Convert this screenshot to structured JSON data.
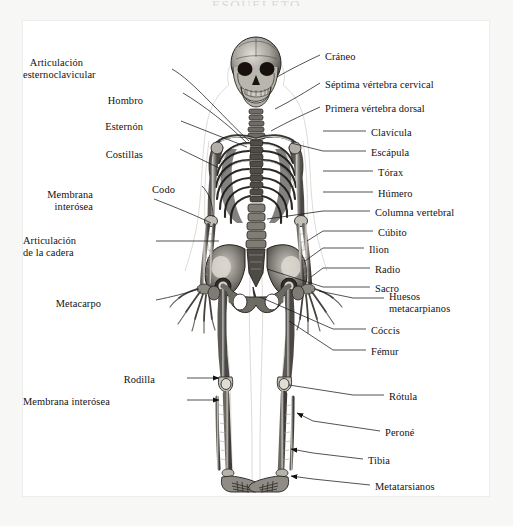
{
  "page": {
    "title": "ESQUELETO",
    "background": "#f7f7f5",
    "plate_background": "#ffffff",
    "border_color": "#ededed",
    "ink_color": "#121212"
  },
  "figure": {
    "name": "human-skeleton-anterior-view",
    "style": "engraving"
  },
  "labels_left": [
    {
      "id": "articulacion-esternoclavicular",
      "lines": [
        "Articulación",
        "esternoclavicular"
      ],
      "x": 60,
      "y": 36,
      "align": "right",
      "leader": "diagonal",
      "arrow": false
    },
    {
      "id": "hombro",
      "lines": [
        "Hombro"
      ],
      "x": 120,
      "y": 74,
      "align": "right",
      "leader": "diagonal",
      "arrow": false
    },
    {
      "id": "esternon",
      "lines": [
        "Esternón"
      ],
      "x": 120,
      "y": 100,
      "align": "right",
      "leader": "diagonal",
      "arrow": false
    },
    {
      "id": "costillas",
      "lines": [
        "Costillas"
      ],
      "x": 120,
      "y": 128,
      "align": "right",
      "leader": "diagonal",
      "arrow": false
    },
    {
      "id": "membrana-interosea-brazo",
      "lines": [
        "Membrana",
        "interósea"
      ],
      "x": 70,
      "y": 168,
      "align": "right",
      "leader": "diagonal",
      "arrow": false
    },
    {
      "id": "codo",
      "lines": [
        "Codo"
      ],
      "x": 152,
      "y": 163,
      "align": "right",
      "leader": "diagonal",
      "arrow": false
    },
    {
      "id": "articulacion-de-la-cadera",
      "lines": [
        "Articulación",
        "de la cadera"
      ],
      "x": 50,
      "y": 214,
      "align": "right",
      "leader": "straight",
      "arrow": false
    },
    {
      "id": "metacarpo",
      "lines": [
        "Metacarpo"
      ],
      "x": 78,
      "y": 277,
      "align": "right",
      "leader": "diagonal",
      "arrow": false
    },
    {
      "id": "rodilla",
      "lines": [
        "Rodilla"
      ],
      "x": 132,
      "y": 353,
      "align": "right",
      "leader": "arrow",
      "arrow": true
    },
    {
      "id": "membrana-interosea-pierna",
      "lines": [
        "Membrana interósea"
      ],
      "x": 72,
      "y": 375,
      "align": "right",
      "leader": "arrow",
      "arrow": true
    }
  ],
  "labels_right": [
    {
      "id": "craneo",
      "lines": [
        "Cráneo"
      ],
      "x": 302,
      "y": 30,
      "align": "left",
      "leader": "diagonal",
      "arrow": false
    },
    {
      "id": "septima-vertebra-cervical",
      "lines": [
        "Séptima vértebra cervical"
      ],
      "x": 302,
      "y": 58,
      "align": "left",
      "leader": "diagonal",
      "arrow": false
    },
    {
      "id": "primera-vertebra-dorsal",
      "lines": [
        "Primera vértebra dorsal"
      ],
      "x": 302,
      "y": 82,
      "align": "left",
      "leader": "diagonal",
      "arrow": false
    },
    {
      "id": "clavicula",
      "lines": [
        "Clavícula"
      ],
      "x": 348,
      "y": 106,
      "align": "left",
      "leader": "straight",
      "arrow": false
    },
    {
      "id": "escapula",
      "lines": [
        "Escápula"
      ],
      "x": 348,
      "y": 126,
      "align": "left",
      "leader": "diagonal",
      "arrow": false
    },
    {
      "id": "torax",
      "lines": [
        "Tórax"
      ],
      "x": 355,
      "y": 146,
      "align": "left",
      "leader": "straight",
      "arrow": false
    },
    {
      "id": "humero",
      "lines": [
        "Húmero"
      ],
      "x": 355,
      "y": 167,
      "align": "left",
      "leader": "straight",
      "arrow": false
    },
    {
      "id": "columna-vertebral",
      "lines": [
        "Columna vertebral"
      ],
      "x": 352,
      "y": 186,
      "align": "left",
      "leader": "diagonal",
      "arrow": false
    },
    {
      "id": "cubito",
      "lines": [
        "Cúbito"
      ],
      "x": 355,
      "y": 206,
      "align": "left",
      "leader": "diagonal",
      "arrow": false
    },
    {
      "id": "ilion",
      "lines": [
        "Ilion"
      ],
      "x": 346,
      "y": 223,
      "align": "left",
      "leader": "straight",
      "arrow": false
    },
    {
      "id": "radio",
      "lines": [
        "Radio"
      ],
      "x": 352,
      "y": 243,
      "align": "left",
      "leader": "diagonal",
      "arrow": false
    },
    {
      "id": "sacro",
      "lines": [
        "Sacro"
      ],
      "x": 352,
      "y": 262,
      "align": "left",
      "leader": "diagonal",
      "arrow": false
    },
    {
      "id": "huesos-metacarpianos",
      "lines": [
        "Huesos",
        "metacarpianos"
      ],
      "x": 366,
      "y": 270,
      "align": "left",
      "leader": "diagonal",
      "arrow": false
    },
    {
      "id": "coccis",
      "lines": [
        "Cóccis"
      ],
      "x": 348,
      "y": 304,
      "align": "left",
      "leader": "diagonal",
      "arrow": false
    },
    {
      "id": "femur",
      "lines": [
        "Fémur"
      ],
      "x": 348,
      "y": 325,
      "align": "left",
      "leader": "diagonal",
      "arrow": false
    },
    {
      "id": "rotula",
      "lines": [
        "Rótula"
      ],
      "x": 366,
      "y": 370,
      "align": "left",
      "leader": "diagonal",
      "arrow": false
    },
    {
      "id": "perone",
      "lines": [
        "Peroné"
      ],
      "x": 362,
      "y": 406,
      "align": "left",
      "leader": "arrow",
      "arrow": true
    },
    {
      "id": "tibia",
      "lines": [
        "Tibia"
      ],
      "x": 345,
      "y": 434,
      "align": "left",
      "leader": "arrow",
      "arrow": true
    },
    {
      "id": "metatarsianos",
      "lines": [
        "Metatarsianos"
      ],
      "x": 352,
      "y": 460,
      "align": "left",
      "leader": "arrow",
      "arrow": true
    }
  ]
}
